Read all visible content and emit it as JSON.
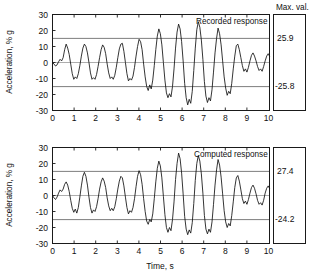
{
  "figure": {
    "xlabel": "Time, s",
    "ylabel": "Acceleration, % g",
    "maxval_header": "Max. val."
  },
  "chart_data": [
    {
      "type": "line",
      "title": "Recorded response",
      "xlabel": "Time, s",
      "ylabel": "Acceleration, % g",
      "xlim": [
        0,
        10
      ],
      "ylim": [
        -30,
        30
      ],
      "xticks": [
        0,
        1,
        2,
        3,
        4,
        5,
        6,
        7,
        8,
        9,
        10
      ],
      "yticks": [
        30,
        20,
        10,
        0,
        -10,
        -20,
        -30
      ],
      "xtick_labels": [
        "0",
        "1",
        "2",
        "3",
        "4",
        "5",
        "6",
        "7",
        "8",
        "9",
        "10"
      ],
      "ytick_labels": [
        "30",
        "20",
        "10",
        "0",
        "-10",
        "-20",
        "-30"
      ],
      "grid": false,
      "legend": "none",
      "reference_lines": [
        15,
        -15,
        0
      ],
      "annotations": [
        {
          "text": "Recorded response",
          "x": 7.0,
          "y": 25
        }
      ],
      "max_value_positive": "25.9",
      "max_value_negative": "-25.8",
      "x": [
        0.0,
        0.07,
        0.14,
        0.21,
        0.28,
        0.35,
        0.42,
        0.49,
        0.56,
        0.63,
        0.7,
        0.77,
        0.84,
        0.91,
        0.98,
        1.05,
        1.12,
        1.19,
        1.26,
        1.33,
        1.4,
        1.47,
        1.54,
        1.61,
        1.68,
        1.75,
        1.82,
        1.89,
        1.96,
        2.03,
        2.1,
        2.17,
        2.24,
        2.31,
        2.38,
        2.45,
        2.52,
        2.59,
        2.66,
        2.73,
        2.8,
        2.87,
        2.94,
        3.01,
        3.08,
        3.15,
        3.22,
        3.29,
        3.36,
        3.43,
        3.5,
        3.57,
        3.64,
        3.71,
        3.78,
        3.85,
        3.92,
        3.99,
        4.06,
        4.13,
        4.2,
        4.27,
        4.34,
        4.41,
        4.48,
        4.55,
        4.62,
        4.69,
        4.76,
        4.83,
        4.9,
        4.97,
        5.04,
        5.11,
        5.18,
        5.25,
        5.32,
        5.39,
        5.46,
        5.53,
        5.6,
        5.67,
        5.74,
        5.81,
        5.88,
        5.95,
        6.02,
        6.09,
        6.16,
        6.23,
        6.3,
        6.37,
        6.44,
        6.51,
        6.58,
        6.65,
        6.72,
        6.79,
        6.86,
        6.93,
        7.0,
        7.07,
        7.14,
        7.21,
        7.28,
        7.35,
        7.42,
        7.49,
        7.56,
        7.63,
        7.7,
        7.77,
        7.84,
        7.91,
        7.98,
        8.05,
        8.12,
        8.19,
        8.26,
        8.33,
        8.4,
        8.47,
        8.54,
        8.61,
        8.68,
        8.75,
        8.82,
        8.89,
        8.96,
        9.03,
        9.1,
        9.17,
        9.24,
        9.31,
        9.38,
        9.45,
        9.52,
        9.59,
        9.66,
        9.73,
        9.8,
        9.87,
        9.94,
        10.0
      ],
      "y": [
        0.0,
        -1.0,
        -2.2,
        -1.5,
        0.5,
        2.0,
        1.0,
        3.0,
        8.0,
        11.5,
        9.0,
        5.0,
        -1.0,
        -7.0,
        -10.5,
        -9.0,
        -10.0,
        -7.0,
        -2.0,
        4.0,
        9.0,
        11.5,
        10.0,
        6.0,
        0.0,
        -6.5,
        -10.5,
        -9.5,
        -10.5,
        -7.5,
        -2.5,
        3.0,
        8.0,
        11.0,
        9.5,
        5.5,
        -1.0,
        -6.5,
        -10.0,
        -9.0,
        -10.5,
        -8.0,
        -3.0,
        3.0,
        8.5,
        11.5,
        12.0,
        7.0,
        0.0,
        -7.0,
        -11.5,
        -10.0,
        -11.0,
        -8.5,
        -3.0,
        4.0,
        10.0,
        14.5,
        13.0,
        8.0,
        -1.0,
        -9.0,
        -15.0,
        -17.5,
        -14.0,
        -16.5,
        -11.0,
        -2.0,
        8.0,
        16.5,
        21.0,
        18.0,
        11.0,
        0.0,
        -11.0,
        -19.0,
        -22.0,
        -19.5,
        -21.5,
        -15.0,
        -4.0,
        9.0,
        19.0,
        24.0,
        21.0,
        13.0,
        1.0,
        -13.0,
        -22.0,
        -26.5,
        -23.0,
        -25.5,
        -18.0,
        -5.0,
        9.0,
        20.5,
        25.5,
        22.0,
        14.0,
        2.0,
        -12.0,
        -21.0,
        -25.0,
        -22.0,
        -24.0,
        -17.0,
        -6.0,
        6.0,
        15.0,
        21.5,
        18.0,
        11.0,
        1.0,
        -9.0,
        -16.0,
        -20.5,
        -18.0,
        -19.5,
        -13.0,
        -4.0,
        4.0,
        10.5,
        11.5,
        8.0,
        3.0,
        -2.0,
        -5.5,
        -4.0,
        -6.0,
        -3.0,
        1.0,
        4.5,
        6.0,
        4.0,
        1.0,
        -2.5,
        -5.0,
        -4.0,
        -5.5,
        -2.5,
        1.0,
        4.0,
        5.5,
        4.0,
        1.5
      ]
    },
    {
      "type": "line",
      "title": "Computed response",
      "xlabel": "Time, s",
      "ylabel": "Acceleration, % g",
      "xlim": [
        0,
        10
      ],
      "ylim": [
        -30,
        30
      ],
      "xticks": [
        0,
        1,
        2,
        3,
        4,
        5,
        6,
        7,
        8,
        9,
        10
      ],
      "yticks": [
        30,
        20,
        10,
        0,
        -10,
        -20,
        -30
      ],
      "xtick_labels": [
        "0",
        "1",
        "2",
        "3",
        "4",
        "5",
        "6",
        "7",
        "8",
        "9",
        "10"
      ],
      "ytick_labels": [
        "30",
        "20",
        "10",
        "0",
        "-10",
        "-20",
        "-30"
      ],
      "grid": false,
      "legend": "none",
      "reference_lines": [
        15,
        -15,
        0
      ],
      "annotations": [
        {
          "text": "Computed response",
          "x": 7.0,
          "y": 25
        }
      ],
      "max_value_positive": "27.4",
      "max_value_negative": "-24.2",
      "x": [
        0.0,
        0.07,
        0.14,
        0.21,
        0.28,
        0.35,
        0.42,
        0.49,
        0.56,
        0.63,
        0.7,
        0.77,
        0.84,
        0.91,
        0.98,
        1.05,
        1.12,
        1.19,
        1.26,
        1.33,
        1.4,
        1.47,
        1.54,
        1.61,
        1.68,
        1.75,
        1.82,
        1.89,
        1.96,
        2.03,
        2.1,
        2.17,
        2.24,
        2.31,
        2.38,
        2.45,
        2.52,
        2.59,
        2.66,
        2.73,
        2.8,
        2.87,
        2.94,
        3.01,
        3.08,
        3.15,
        3.22,
        3.29,
        3.36,
        3.43,
        3.5,
        3.57,
        3.64,
        3.71,
        3.78,
        3.85,
        3.92,
        3.99,
        4.06,
        4.13,
        4.2,
        4.27,
        4.34,
        4.41,
        4.48,
        4.55,
        4.62,
        4.69,
        4.76,
        4.83,
        4.9,
        4.97,
        5.04,
        5.11,
        5.18,
        5.25,
        5.32,
        5.39,
        5.46,
        5.53,
        5.6,
        5.67,
        5.74,
        5.81,
        5.88,
        5.95,
        6.02,
        6.09,
        6.16,
        6.23,
        6.3,
        6.37,
        6.44,
        6.51,
        6.58,
        6.65,
        6.72,
        6.79,
        6.86,
        6.93,
        7.0,
        7.07,
        7.14,
        7.21,
        7.28,
        7.35,
        7.42,
        7.49,
        7.56,
        7.63,
        7.7,
        7.77,
        7.84,
        7.91,
        7.98,
        8.05,
        8.12,
        8.19,
        8.26,
        8.33,
        8.4,
        8.47,
        8.54,
        8.61,
        8.68,
        8.75,
        8.82,
        8.89,
        8.96,
        9.03,
        9.1,
        9.17,
        9.24,
        9.31,
        9.38,
        9.45,
        9.52,
        9.59,
        9.66,
        9.73,
        9.8,
        9.87,
        9.94,
        10.0
      ],
      "y": [
        0.0,
        -1.5,
        -2.5,
        -1.0,
        1.5,
        3.5,
        2.5,
        4.0,
        7.0,
        8.5,
        6.5,
        2.5,
        -3.0,
        -8.0,
        -10.5,
        -8.5,
        -11.0,
        -7.5,
        -1.0,
        6.0,
        12.0,
        14.5,
        12.0,
        6.5,
        -1.0,
        -7.5,
        -11.0,
        -9.0,
        -10.0,
        -7.0,
        -2.0,
        4.0,
        8.5,
        11.0,
        9.0,
        5.0,
        -1.5,
        -6.5,
        -9.5,
        -8.0,
        -9.5,
        -7.0,
        -2.0,
        4.0,
        9.0,
        12.0,
        11.0,
        6.0,
        -1.0,
        -7.5,
        -11.5,
        -9.5,
        -10.5,
        -7.5,
        -2.0,
        5.5,
        12.0,
        15.5,
        13.0,
        7.0,
        -2.0,
        -10.0,
        -16.0,
        -18.0,
        -15.0,
        -16.5,
        -11.5,
        -2.0,
        8.5,
        17.0,
        21.5,
        18.5,
        11.0,
        -0.5,
        -12.0,
        -20.0,
        -23.0,
        -20.0,
        -22.0,
        -15.0,
        -4.0,
        10.0,
        20.0,
        26.5,
        23.0,
        14.0,
        1.0,
        -13.0,
        -21.0,
        -24.5,
        -21.5,
        -23.5,
        -17.0,
        -5.0,
        9.5,
        20.0,
        25.0,
        21.5,
        13.5,
        1.5,
        -12.5,
        -21.0,
        -24.0,
        -21.0,
        -23.0,
        -16.5,
        -5.5,
        6.5,
        16.0,
        22.5,
        19.0,
        11.5,
        1.0,
        -9.5,
        -16.5,
        -20.0,
        -17.5,
        -19.0,
        -12.5,
        -4.0,
        5.0,
        11.0,
        12.5,
        9.0,
        3.5,
        -2.0,
        -5.0,
        -3.5,
        -5.5,
        -2.5,
        1.5,
        5.0,
        6.5,
        4.5,
        1.0,
        -3.0,
        -5.5,
        -4.5,
        -6.0,
        -3.0,
        1.5,
        4.5,
        6.0,
        4.5,
        1.0
      ]
    }
  ]
}
